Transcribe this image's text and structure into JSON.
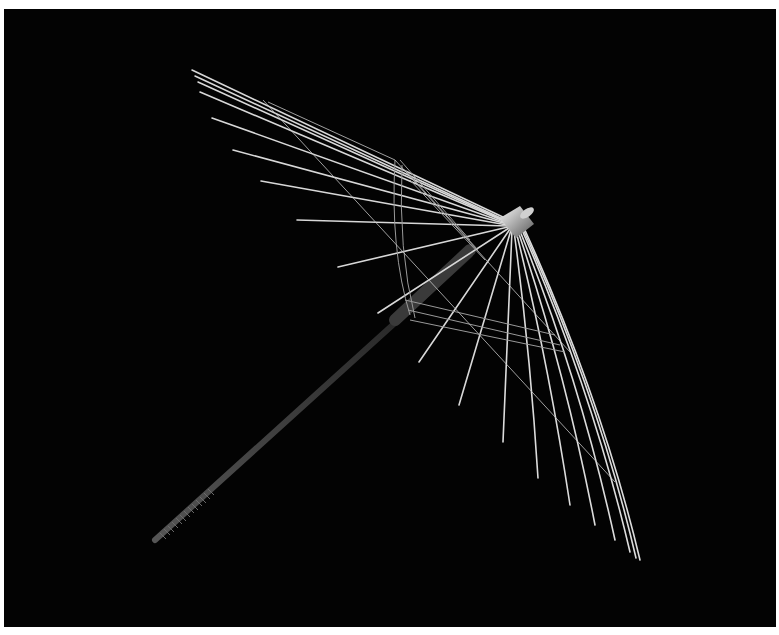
{
  "image": {
    "subject": "Umbrella skeleton (ribs and handle) photographed against a black background",
    "background_color": "#030303",
    "border_color": "#ffffff",
    "rib_color": "#e6e6e6",
    "hub": {
      "x": 510,
      "y": 222
    },
    "handle_end": {
      "x": 155,
      "y": 540
    }
  }
}
